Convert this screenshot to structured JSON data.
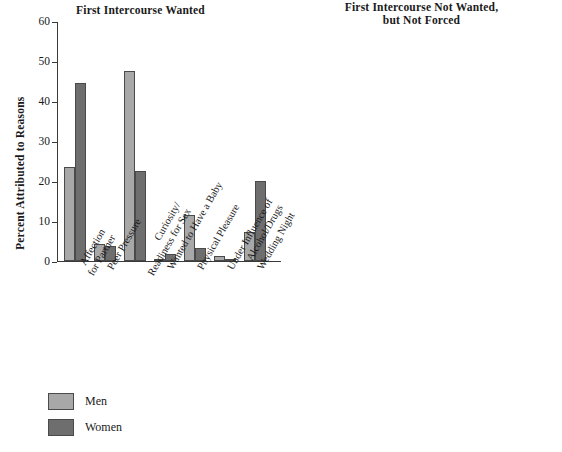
{
  "legend": {
    "position": "bottom-left",
    "entries": [
      {
        "label": "Men",
        "color": "#a8a8a8"
      },
      {
        "label": "Women",
        "color": "#6e6e6e"
      }
    ]
  },
  "axis": {
    "ylabel": "Percent Attributed to Reasons",
    "ticks": [
      "0",
      "10",
      "20",
      "30",
      "40",
      "50",
      "60"
    ]
  },
  "categories_display": [
    {
      "l1": "Affection",
      "l2": "for Partner"
    },
    {
      "l1": "Peer Pressure",
      "l2": ""
    },
    {
      "l1": "Curiosity/",
      "l2": "Readiness for Sex"
    },
    {
      "l1": "Wanted to Have a Baby",
      "l2": ""
    },
    {
      "l1": "Physical Pleasure",
      "l2": ""
    },
    {
      "l1": "Under Influence of",
      "l2": "Alcohol/Drugs"
    },
    {
      "l1": "Wedding Night",
      "l2": ""
    }
  ],
  "chart_data": [
    {
      "type": "bar",
      "title": "First Intercourse Wanted",
      "xlabel": "",
      "ylabel": "Percent Attributed to Reasons",
      "ylim": [
        0,
        60
      ],
      "ytick_step": 10,
      "grid": false,
      "legend": [
        "Men",
        "Women"
      ],
      "categories": [
        "Affection for Partner",
        "Peer Pressure",
        "Curiosity/Readiness for Sex",
        "Wanted to Have a Baby",
        "Physical Pleasure",
        "Under Influence of Alcohol/Drugs",
        "Wedding Night"
      ],
      "series": [
        {
          "name": "Men",
          "color": "#a8a8a8",
          "values": [
            23.5,
            4.3,
            47.5,
            0.5,
            11.5,
            1.2,
            7.2
          ]
        },
        {
          "name": "Women",
          "color": "#6e6e6e",
          "values": [
            44.5,
            3.8,
            22.5,
            1.8,
            3.2,
            0.6,
            20.0
          ]
        }
      ]
    },
    {
      "type": "bar",
      "title": "First Intercourse Not Wanted, but Not Forced",
      "title_line1": "First Intercourse Not Wanted,",
      "title_line2": "but Not Forced",
      "xlabel": "",
      "ylabel": "Percent Attributed to Reasons",
      "ylim": [
        0,
        60
      ],
      "ytick_step": 10,
      "grid": false,
      "legend": [
        "Men",
        "Women"
      ],
      "categories": [
        "Affection for Partner",
        "Peer Pressure",
        "Curiosity/Readiness for Sex",
        "Wanted to Have a Baby",
        "Physical Pleasure",
        "Under Influence of Alcohol/Drugs",
        "Wedding Night"
      ],
      "series": [
        {
          "name": "Men",
          "color": "#a8a8a8",
          "values": [
            9.0,
            24.8,
            43.5,
            0.5,
            5.8,
            3.0,
            1.3
          ]
        },
        {
          "name": "Women",
          "color": "#6e6e6e",
          "values": [
            33.0,
            21.8,
            22.0,
            1.8,
            3.4,
            7.0,
            3.0
          ]
        }
      ]
    }
  ]
}
